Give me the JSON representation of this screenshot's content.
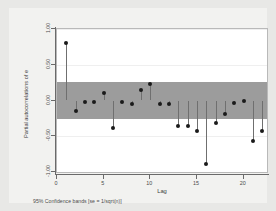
{
  "chart_data": {
    "type": "scatter",
    "title": "",
    "xlabel": "Lag",
    "ylabel": "Partial autocorrelations of e",
    "caption": "95% Confidence bands [se = 1/sqrt(n)]",
    "xlim": [
      0,
      22.5
    ],
    "ylim": [
      -1.0,
      1.0
    ],
    "xticks": [
      0,
      5,
      10,
      15,
      20
    ],
    "xtick_labels": [
      "0",
      "5",
      "10",
      "15",
      "20"
    ],
    "yticks": [
      1.0,
      0.5,
      0.0,
      -0.5,
      -1.0
    ],
    "ytick_labels": [
      "1.00",
      "0.50",
      "0.00",
      "-0.50",
      "-1.00"
    ],
    "grid": true,
    "legend": "none",
    "confidence_band": {
      "upper": 0.26,
      "lower": -0.26,
      "color": "#9c9c9c",
      "label": "95% Confidence bands [se = 1/sqrt(n)]"
    },
    "x": [
      1,
      2,
      3,
      4,
      5,
      6,
      7,
      8,
      9,
      10,
      11,
      12,
      13,
      14,
      15,
      16,
      17,
      18,
      19,
      20,
      21,
      22
    ],
    "values": [
      0.8,
      -0.15,
      -0.02,
      -0.02,
      0.11,
      -0.39,
      -0.02,
      -0.05,
      0.14,
      0.23,
      -0.05,
      -0.05,
      -0.36,
      -0.35,
      -0.43,
      -0.89,
      -0.31,
      -0.19,
      -0.04,
      -0.01,
      -0.56,
      -0.43
    ],
    "series": [
      {
        "name": "Partial autocorrelations of e",
        "values": [
          0.8,
          -0.15,
          -0.02,
          -0.02,
          0.11,
          -0.39,
          -0.02,
          -0.05,
          0.14,
          0.23,
          -0.05,
          -0.05,
          -0.36,
          -0.35,
          -0.43,
          -0.89,
          -0.31,
          -0.19,
          -0.04,
          -0.01,
          -0.56,
          -0.43
        ]
      }
    ]
  }
}
